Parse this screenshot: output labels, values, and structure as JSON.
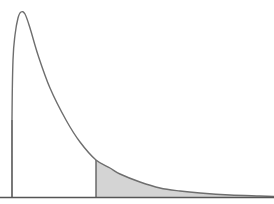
{
  "diagram": {
    "type": "right-skewed probability density curve with shaded upper tail",
    "colors": {
      "background": "#ffffff",
      "curve": "#6e6e6e",
      "axis": "#555555",
      "shade": "#d4d4d4",
      "shade_edge": "#555555"
    },
    "curve_points": [
      [
        12,
        197
      ],
      [
        12,
        120
      ],
      [
        13,
        60
      ],
      [
        15,
        35
      ],
      [
        18,
        18
      ],
      [
        21,
        12
      ],
      [
        25,
        14
      ],
      [
        30,
        28
      ],
      [
        38,
        55
      ],
      [
        50,
        88
      ],
      [
        66,
        120
      ],
      [
        80,
        142
      ],
      [
        96,
        160
      ],
      [
        110,
        168
      ],
      [
        120,
        174
      ],
      [
        140,
        182
      ],
      [
        160,
        188
      ],
      [
        180,
        191
      ],
      [
        200,
        193
      ],
      [
        230,
        195
      ],
      [
        260,
        196
      ],
      [
        274,
        196.5
      ]
    ],
    "shaded_region": {
      "x_start": 96,
      "x_end": 274
    },
    "baseline_y": 197.5,
    "left_line_x": 12
  }
}
